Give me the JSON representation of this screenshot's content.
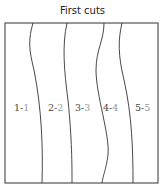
{
  "title": "First cuts",
  "regions": [
    {
      "a": "1-",
      "b": "1"
    },
    {
      "a": "2-",
      "b": "2"
    },
    {
      "a": "3-",
      "b": "3"
    },
    {
      "a": "4-",
      "b": "4"
    },
    {
      "a": "5-",
      "b": "5"
    }
  ],
  "colors": {
    "line": "#333333",
    "label_dark": "#444444",
    "label_light": "#999999"
  }
}
